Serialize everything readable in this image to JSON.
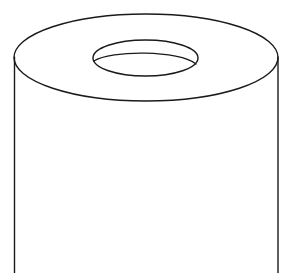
{
  "figure": {
    "colors": {
      "background": "#ffffff",
      "stroke": "#1a1a1a"
    }
  }
}
